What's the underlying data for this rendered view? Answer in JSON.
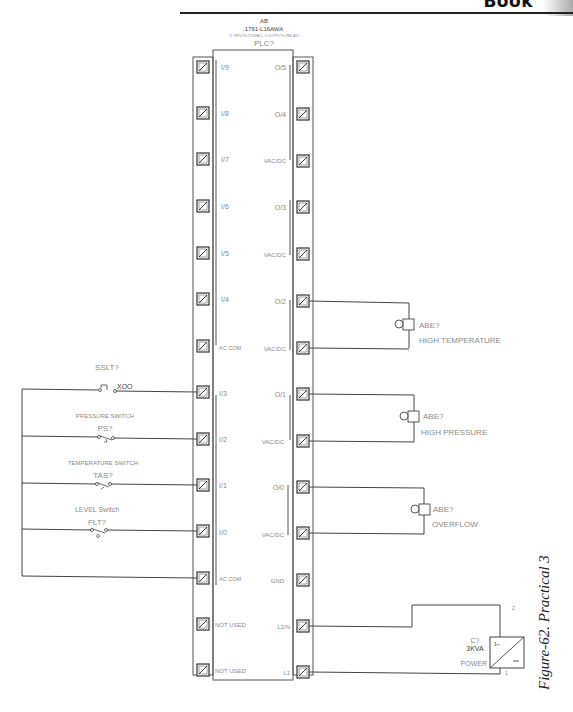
{
  "header": {
    "title": "Book"
  },
  "plc": {
    "vendor": "AB",
    "model": "1761-L16AWA",
    "subtitle": "11 INPUTS (120VAC), 5 OUTPUTS (RELAY)",
    "tag": "PLC?",
    "rows": [
      {
        "left_label": "I/9",
        "right_label": "O/5"
      },
      {
        "left_label": "I/8",
        "right_label": "O/4"
      },
      {
        "left_label": "I/7",
        "right_label": "VAC/DC"
      },
      {
        "left_label": "I/6",
        "right_label": "O/3"
      },
      {
        "left_label": "I/5",
        "right_label": "VAC/DC"
      },
      {
        "left_label": "I/4",
        "right_label": "O/2"
      },
      {
        "left_label": "AC COM",
        "right_label": "VAC/DC"
      },
      {
        "left_label": "I/3",
        "right_label": "O/1"
      },
      {
        "left_label": "I/2",
        "right_label": "VAC/DC"
      },
      {
        "left_label": "I/1",
        "right_label": "O/0"
      },
      {
        "left_label": "I/0",
        "right_label": "VAC/DC"
      },
      {
        "left_label": "AC COM",
        "right_label": "GND"
      },
      {
        "left_label": "NOT USED",
        "right_label": "L2/N"
      },
      {
        "left_label": "NOT USED",
        "right_label": "L1"
      }
    ]
  },
  "inputs": [
    {
      "title": "SSLT?",
      "contact": "XOO",
      "terminal": "I/3"
    },
    {
      "title": "PRESSURE SWITCH",
      "tag": "PS?",
      "terminal": "I/2"
    },
    {
      "title": "TEMPERATURE SWITCH",
      "tag": "TAS?",
      "terminal": "I/1"
    },
    {
      "title": "LEVEL Switch",
      "tag": "FLT?",
      "terminal": "I/0"
    }
  ],
  "outputs": [
    {
      "tag": "ABE?",
      "label": "HIGH TEMPERATURE",
      "terminal": "O/2"
    },
    {
      "tag": "ABE?",
      "label": "HIGH PRESSURE",
      "terminal": "O/1"
    },
    {
      "tag": "ABE?",
      "label": "OVERFLOW",
      "terminal": "O/0"
    }
  ],
  "power": {
    "tag": "C?",
    "rating": "3KVA",
    "label": "POWER",
    "top_pin": "2",
    "bottom_pin": "1",
    "ac_symbol": "1~",
    "dc_symbol": "=="
  },
  "caption": "Figure-62. Practical 3"
}
